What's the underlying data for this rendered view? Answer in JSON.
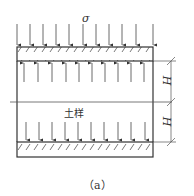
{
  "diagram": {
    "load_symbol": "σ",
    "soil_label": "土样",
    "dimension_top": "H",
    "dimension_bottom": "H",
    "caption": "（a）",
    "arrows": {
      "top_load_count": 11,
      "upward_count": 10,
      "downward_count": 10
    },
    "colors": {
      "line": "#333333",
      "hatch": "#555555"
    }
  }
}
